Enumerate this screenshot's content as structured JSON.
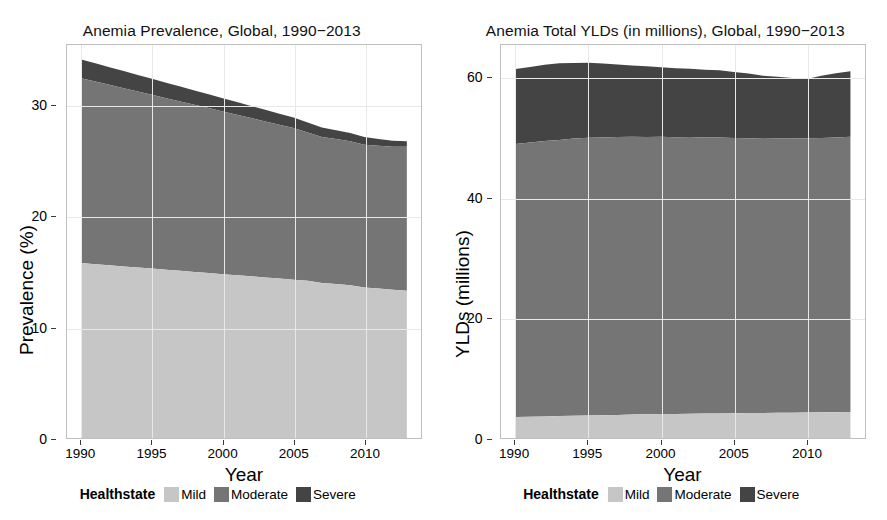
{
  "figure": {
    "background": "#ffffff",
    "colors": {
      "mild": "#c6c6c6",
      "moderate": "#757575",
      "severe": "#444444",
      "panel_border": "#bfbfbf",
      "gridline": "#e8e8e8"
    }
  },
  "legend": {
    "title": "Healthstate",
    "items": [
      {
        "label": "Mild",
        "color": "#c6c6c6"
      },
      {
        "label": "Moderate",
        "color": "#757575"
      },
      {
        "label": "Severe",
        "color": "#444444"
      }
    ]
  },
  "chart_data": [
    {
      "type": "area",
      "stacked": true,
      "title": "Anemia Prevalence, Global, 1990−2013",
      "xlabel": "Year",
      "ylabel": "Prevalence (%)",
      "xlim": [
        1989,
        2014
      ],
      "ylim": [
        0,
        35.5
      ],
      "xticks": [
        1990,
        1995,
        2000,
        2005,
        2010
      ],
      "yticks": [
        0,
        10,
        20,
        30
      ],
      "xticklabels": [
        "1990",
        "1995",
        "2000",
        "2005",
        "2010"
      ],
      "yticklabels": [
        "0",
        "10",
        "20",
        "30"
      ],
      "grid": true,
      "legend_position": "bottom",
      "x": [
        1990,
        1991,
        1992,
        1993,
        1994,
        1995,
        1996,
        1997,
        1998,
        1999,
        2000,
        2001,
        2002,
        2003,
        2004,
        2005,
        2006,
        2007,
        2008,
        2009,
        2010,
        2011,
        2012,
        2013
      ],
      "series": [
        {
          "name": "Mild",
          "color": "#c6c6c6",
          "values": [
            15.8,
            15.7,
            15.6,
            15.5,
            15.4,
            15.3,
            15.2,
            15.1,
            15.0,
            14.9,
            14.8,
            14.7,
            14.6,
            14.5,
            14.4,
            14.3,
            14.2,
            14.0,
            13.9,
            13.8,
            13.6,
            13.5,
            13.4,
            13.3
          ]
        },
        {
          "name": "Moderate",
          "color": "#757575",
          "values": [
            16.7,
            16.5,
            16.3,
            16.1,
            15.9,
            15.7,
            15.5,
            15.3,
            15.1,
            14.9,
            14.7,
            14.5,
            14.3,
            14.1,
            13.9,
            13.7,
            13.4,
            13.2,
            13.1,
            13.0,
            12.9,
            12.9,
            12.9,
            13.0
          ]
        },
        {
          "name": "Severe",
          "color": "#444444",
          "values": [
            1.7,
            1.65,
            1.6,
            1.55,
            1.5,
            1.45,
            1.4,
            1.35,
            1.3,
            1.25,
            1.2,
            1.15,
            1.1,
            1.05,
            1.0,
            0.95,
            0.9,
            0.85,
            0.8,
            0.75,
            0.7,
            0.6,
            0.55,
            0.5
          ]
        }
      ],
      "totals": [
        34.2,
        33.85,
        33.5,
        33.15,
        32.8,
        32.45,
        32.1,
        31.75,
        31.4,
        31.05,
        30.7,
        30.35,
        30.0,
        29.65,
        29.3,
        28.95,
        28.5,
        28.05,
        27.8,
        27.55,
        27.2,
        27.0,
        26.85,
        26.8
      ]
    },
    {
      "type": "area",
      "stacked": true,
      "title": "Anemia Total YLDs (in millions), Global, 1990−2013",
      "xlabel": "Year",
      "ylabel": "YLDs (millions)",
      "xlim": [
        1989,
        2014
      ],
      "ylim": [
        0,
        65.5
      ],
      "xticks": [
        1990,
        1995,
        2000,
        2005,
        2010
      ],
      "yticks": [
        0,
        20,
        40,
        60
      ],
      "xticklabels": [
        "1990",
        "1995",
        "2000",
        "2005",
        "2010"
      ],
      "yticklabels": [
        "0",
        "20",
        "40",
        "60"
      ],
      "grid": true,
      "legend_position": "bottom",
      "x": [
        1990,
        1991,
        1992,
        1993,
        1994,
        1995,
        1996,
        1997,
        1998,
        1999,
        2000,
        2001,
        2002,
        2003,
        2004,
        2005,
        2006,
        2007,
        2008,
        2009,
        2010,
        2011,
        2012,
        2013
      ],
      "series": [
        {
          "name": "Mild",
          "color": "#c6c6c6",
          "values": [
            3.5,
            3.55,
            3.6,
            3.65,
            3.7,
            3.75,
            3.8,
            3.85,
            3.9,
            3.95,
            4.0,
            4.02,
            4.05,
            4.08,
            4.1,
            4.12,
            4.15,
            4.18,
            4.2,
            4.22,
            4.25,
            4.28,
            4.3,
            4.32
          ]
        },
        {
          "name": "Moderate",
          "color": "#757575",
          "values": [
            45.5,
            45.7,
            45.9,
            46.0,
            46.2,
            46.3,
            46.3,
            46.3,
            46.3,
            46.2,
            46.2,
            46.1,
            46.1,
            46.0,
            46.0,
            45.9,
            45.8,
            45.7,
            45.7,
            45.7,
            45.7,
            45.7,
            45.8,
            45.9
          ]
        },
        {
          "name": "Severe",
          "color": "#444444",
          "values": [
            12.5,
            12.6,
            12.7,
            12.8,
            12.6,
            12.5,
            12.3,
            12.1,
            11.9,
            11.8,
            11.6,
            11.5,
            11.4,
            11.3,
            11.2,
            11.0,
            10.8,
            10.5,
            10.3,
            10.1,
            9.9,
            10.4,
            10.7,
            10.9
          ]
        }
      ],
      "totals": [
        61.5,
        61.85,
        62.2,
        62.45,
        62.5,
        62.55,
        62.4,
        62.25,
        62.1,
        61.95,
        61.8,
        61.62,
        61.55,
        61.38,
        61.3,
        61.02,
        60.75,
        60.38,
        60.2,
        60.02,
        59.85,
        60.38,
        60.8,
        61.12
      ]
    }
  ]
}
